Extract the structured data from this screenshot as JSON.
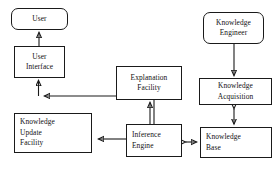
{
  "diagram": {
    "type": "flowchart",
    "background": "#ffffff",
    "stroke_color": "#1a1a1a",
    "nodes": [
      {
        "id": "user",
        "label": "User",
        "lines": [
          "User"
        ],
        "shape": "rounded-rect",
        "align": "center",
        "x": 11,
        "y": 8,
        "w": 57,
        "h": 22
      },
      {
        "id": "user_iface",
        "label": "User Interface",
        "lines": [
          "User",
          "Interface"
        ],
        "shape": "rect",
        "align": "center",
        "x": 14,
        "y": 46,
        "w": 51,
        "h": 32
      },
      {
        "id": "kuf",
        "label": "Knowledge Update Facility",
        "lines": [
          "Knowledge",
          "Update",
          "Facility"
        ],
        "shape": "rect",
        "align": "left",
        "x": 14,
        "y": 113,
        "w": 78,
        "h": 40
      },
      {
        "id": "explanation",
        "label": "Explanation Facility",
        "lines": [
          "Explanation",
          "Facility"
        ],
        "shape": "rect",
        "align": "center",
        "x": 116,
        "y": 66,
        "w": 66,
        "h": 34
      },
      {
        "id": "inference",
        "label": "Inference Engine",
        "lines": [
          "Inference",
          "Engine"
        ],
        "shape": "rect",
        "align": "left",
        "x": 126,
        "y": 124,
        "w": 56,
        "h": 33
      },
      {
        "id": "kengineer",
        "label": "Knowledge Engineer",
        "lines": [
          "Knowledge",
          "Engineer"
        ],
        "shape": "rounded-rect",
        "align": "center",
        "x": 203,
        "y": 12,
        "w": 61,
        "h": 32
      },
      {
        "id": "kacq",
        "label": "Knowledge Acquisition",
        "lines": [
          "Knowledge",
          "Acquisition"
        ],
        "shape": "rect",
        "align": "center",
        "x": 199,
        "y": 78,
        "w": 73,
        "h": 27
      },
      {
        "id": "kbase",
        "label": "Knowledge Base",
        "lines": [
          "Knowledge",
          "Base"
        ],
        "shape": "rect",
        "align": "left",
        "x": 200,
        "y": 127,
        "w": 72,
        "h": 31
      }
    ],
    "edges": [
      {
        "id": "e1",
        "from": "user_iface",
        "to": "user",
        "arrows": "single-up",
        "label": ""
      },
      {
        "id": "e2",
        "from": "junction",
        "to": "user_iface",
        "arrows": "single-up",
        "label": ""
      },
      {
        "id": "e3",
        "from": "inference",
        "to": "junction",
        "arrows": "single-left",
        "label": ""
      },
      {
        "id": "e4",
        "from": "inference",
        "to": "kuf",
        "arrows": "single-left",
        "label": ""
      },
      {
        "id": "e5",
        "from": "inference",
        "to": "explanation",
        "arrows": "single-up",
        "label": ""
      },
      {
        "id": "e6",
        "from": "kengineer",
        "to": "kacq",
        "arrows": "single-down",
        "label": ""
      },
      {
        "id": "e7",
        "from": "kacq",
        "to": "kbase",
        "arrows": "double",
        "label": ""
      },
      {
        "id": "e8",
        "from": "inference",
        "to": "kbase",
        "arrows": "double",
        "label": ""
      }
    ]
  }
}
